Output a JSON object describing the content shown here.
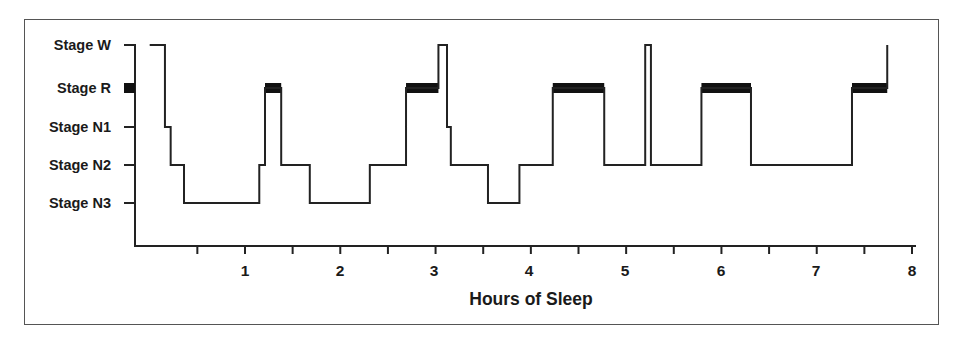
{
  "chart_data": {
    "type": "line",
    "subtype": "hypnogram-step",
    "title": "",
    "xlabel": "Hours of Sleep",
    "ylabel": "",
    "xlim": [
      0,
      8
    ],
    "x_ticks_major": [
      1,
      2,
      3,
      4,
      5,
      6,
      7,
      8
    ],
    "x_ticks_minor": [
      0.5,
      1.5,
      2.5,
      3.5,
      4.5,
      5.5,
      6.5,
      7.5
    ],
    "y_categories": [
      "Stage W",
      "Stage R",
      "Stage N1",
      "Stage N2",
      "Stage N3"
    ],
    "grid": false,
    "legend": null,
    "rem_marker": "solid black bar drawn at Stage R level",
    "segments": [
      {
        "stage": "Stage W",
        "start": 0.0,
        "end": 0.16
      },
      {
        "stage": "Stage N1",
        "start": 0.16,
        "end": 0.22
      },
      {
        "stage": "Stage N2",
        "start": 0.22,
        "end": 0.36
      },
      {
        "stage": "Stage N3",
        "start": 0.36,
        "end": 1.15
      },
      {
        "stage": "Stage N2",
        "start": 1.15,
        "end": 1.21
      },
      {
        "stage": "Stage R",
        "start": 1.21,
        "end": 1.38
      },
      {
        "stage": "Stage N2",
        "start": 1.38,
        "end": 1.68
      },
      {
        "stage": "Stage N3",
        "start": 1.68,
        "end": 2.31
      },
      {
        "stage": "Stage N2",
        "start": 2.31,
        "end": 2.69
      },
      {
        "stage": "Stage R",
        "start": 2.69,
        "end": 3.03
      },
      {
        "stage": "Stage W",
        "start": 3.03,
        "end": 3.12
      },
      {
        "stage": "Stage N1",
        "start": 3.12,
        "end": 3.16
      },
      {
        "stage": "Stage N2",
        "start": 3.16,
        "end": 3.55
      },
      {
        "stage": "Stage N3",
        "start": 3.55,
        "end": 3.88
      },
      {
        "stage": "Stage N2",
        "start": 3.88,
        "end": 4.23
      },
      {
        "stage": "Stage R",
        "start": 4.23,
        "end": 4.77
      },
      {
        "stage": "Stage N2",
        "start": 4.77,
        "end": 5.2
      },
      {
        "stage": "Stage W",
        "start": 5.2,
        "end": 5.26
      },
      {
        "stage": "Stage N2",
        "start": 5.26,
        "end": 5.79
      },
      {
        "stage": "Stage R",
        "start": 5.79,
        "end": 6.31
      },
      {
        "stage": "Stage N2",
        "start": 6.31,
        "end": 7.37
      },
      {
        "stage": "Stage R",
        "start": 7.37,
        "end": 7.74
      },
      {
        "stage": "Stage W",
        "start": 7.74,
        "end": 7.74
      }
    ]
  },
  "colors": {
    "line": "#222222",
    "rem_bar": "#111111",
    "frame": "#555555",
    "text": "#1a1a1a"
  },
  "labels": {
    "y": [
      "Stage W",
      "Stage R",
      "Stage N1",
      "Stage N2",
      "Stage N3"
    ],
    "x": [
      "1",
      "2",
      "3",
      "4",
      "5",
      "6",
      "7",
      "8"
    ],
    "xtitle": "Hours of Sleep"
  }
}
